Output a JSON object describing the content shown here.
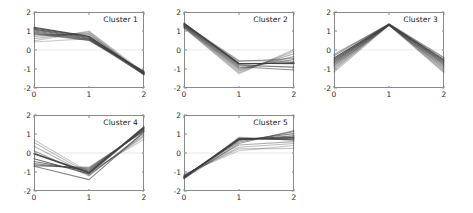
{
  "figure": {
    "width": 473,
    "height": 213,
    "background": "#ffffff",
    "layout": "2 rows x 3 columns of small-multiple line panels; 5 panels drawn, bottom-right cell empty",
    "line_color": "#404040",
    "frame_color": "#8a8a8a",
    "tick_label_color": "#2b2b2b"
  },
  "chart_data": {
    "type": "line",
    "title": "",
    "xlabel": "",
    "ylabel": "",
    "xlim": [
      0,
      2
    ],
    "ylim": [
      -2,
      2
    ],
    "xticks": [
      0,
      1,
      2
    ],
    "xticklabels": [
      "0",
      "1",
      "2"
    ],
    "yticks": [
      -2,
      -1,
      0,
      1,
      2
    ],
    "yticklabels": [
      "-2",
      "-1",
      "0",
      "1",
      "2"
    ],
    "x": [
      0,
      1,
      2
    ],
    "grid": false,
    "legend": "none",
    "panels": [
      {
        "label": "Cluster 1",
        "row": 0,
        "col": 0,
        "series": [
          {
            "name": "s1",
            "values": [
              1.2,
              0.72,
              -1.22
            ],
            "alpha": 0.85
          },
          {
            "name": "s2",
            "values": [
              1.15,
              0.7,
              -1.25
            ],
            "alpha": 0.8
          },
          {
            "name": "s3",
            "values": [
              1.1,
              0.66,
              -1.18
            ],
            "alpha": 0.75
          },
          {
            "name": "s4",
            "values": [
              1.05,
              0.62,
              -1.3
            ],
            "alpha": 0.7
          },
          {
            "name": "s5",
            "values": [
              1.0,
              0.58,
              -1.2
            ],
            "alpha": 0.65
          },
          {
            "name": "s6",
            "values": [
              0.95,
              0.55,
              -1.15
            ],
            "alpha": 0.6
          },
          {
            "name": "s7",
            "values": [
              0.9,
              0.52,
              -1.28
            ],
            "alpha": 0.55
          },
          {
            "name": "s8",
            "values": [
              0.85,
              0.5,
              -1.1
            ],
            "alpha": 0.5
          },
          {
            "name": "s9",
            "values": [
              0.8,
              0.82,
              -1.24
            ],
            "alpha": 0.45
          },
          {
            "name": "s10",
            "values": [
              0.72,
              0.88,
              -1.3
            ],
            "alpha": 0.4
          },
          {
            "name": "s11",
            "values": [
              0.6,
              0.95,
              -1.26
            ],
            "alpha": 0.35
          },
          {
            "name": "s12",
            "values": [
              0.48,
              1.0,
              -1.2
            ],
            "alpha": 0.3
          },
          {
            "name": "s13",
            "values": [
              0.42,
              0.6,
              -1.12
            ],
            "alpha": 0.28
          }
        ]
      },
      {
        "label": "Cluster 2",
        "row": 0,
        "col": 1,
        "series": [
          {
            "name": "s1",
            "values": [
              1.42,
              -0.72,
              -0.7
            ],
            "alpha": 0.88
          },
          {
            "name": "s2",
            "values": [
              1.38,
              -0.7,
              -0.72
            ],
            "alpha": 0.82
          },
          {
            "name": "s3",
            "values": [
              1.35,
              -0.75,
              -0.66
            ],
            "alpha": 0.76
          },
          {
            "name": "s4",
            "values": [
              1.32,
              -0.8,
              -0.9
            ],
            "alpha": 0.68
          },
          {
            "name": "s5",
            "values": [
              1.28,
              -0.88,
              -1.05
            ],
            "alpha": 0.6
          },
          {
            "name": "s6",
            "values": [
              1.25,
              -0.95,
              -0.5
            ],
            "alpha": 0.54
          },
          {
            "name": "s7",
            "values": [
              1.22,
              -1.02,
              -0.35
            ],
            "alpha": 0.48
          },
          {
            "name": "s8",
            "values": [
              1.2,
              -1.1,
              -0.2
            ],
            "alpha": 0.42
          },
          {
            "name": "s9",
            "values": [
              1.18,
              -1.18,
              -0.08
            ],
            "alpha": 0.36
          },
          {
            "name": "s10",
            "values": [
              1.15,
              -1.25,
              0.02
            ],
            "alpha": 0.3
          },
          {
            "name": "s11",
            "values": [
              1.3,
              -0.6,
              -0.45
            ],
            "alpha": 0.45
          },
          {
            "name": "s12",
            "values": [
              1.36,
              -0.55,
              -0.6
            ],
            "alpha": 0.4
          }
        ]
      },
      {
        "label": "Cluster 3",
        "row": 0,
        "col": 2,
        "series": [
          {
            "name": "s1",
            "values": [
              -0.42,
              1.36,
              -0.52
            ],
            "alpha": 0.88
          },
          {
            "name": "s2",
            "values": [
              -0.5,
              1.34,
              -0.58
            ],
            "alpha": 0.82
          },
          {
            "name": "s3",
            "values": [
              -0.58,
              1.33,
              -0.66
            ],
            "alpha": 0.76
          },
          {
            "name": "s4",
            "values": [
              -0.66,
              1.35,
              -0.74
            ],
            "alpha": 0.7
          },
          {
            "name": "s5",
            "values": [
              -0.74,
              1.32,
              -0.82
            ],
            "alpha": 0.62
          },
          {
            "name": "s6",
            "values": [
              -0.82,
              1.3,
              -0.9
            ],
            "alpha": 0.55
          },
          {
            "name": "s7",
            "values": [
              -0.9,
              1.34,
              -0.98
            ],
            "alpha": 0.48
          },
          {
            "name": "s8",
            "values": [
              -0.98,
              1.31,
              -1.06
            ],
            "alpha": 0.42
          },
          {
            "name": "s9",
            "values": [
              -1.06,
              1.33,
              -1.14
            ],
            "alpha": 0.36
          },
          {
            "name": "s10",
            "values": [
              -1.16,
              1.3,
              -1.2
            ],
            "alpha": 0.3
          },
          {
            "name": "s11",
            "values": [
              -0.3,
              1.38,
              -0.4
            ],
            "alpha": 0.5
          },
          {
            "name": "s12",
            "values": [
              -0.22,
              1.36,
              -0.46
            ],
            "alpha": 0.4
          }
        ]
      },
      {
        "label": "Cluster 4",
        "row": 1,
        "col": 0,
        "series": [
          {
            "name": "s1",
            "values": [
              -0.02,
              -1.02,
              1.34
            ],
            "alpha": 0.88
          },
          {
            "name": "s2",
            "values": [
              -0.05,
              -1.05,
              1.38
            ],
            "alpha": 0.82
          },
          {
            "name": "s3",
            "values": [
              -0.3,
              -1.1,
              1.3
            ],
            "alpha": 0.76
          },
          {
            "name": "s4",
            "values": [
              -0.45,
              -0.95,
              1.26
            ],
            "alpha": 0.7
          },
          {
            "name": "s5",
            "values": [
              -0.55,
              -0.88,
              1.22
            ],
            "alpha": 0.62
          },
          {
            "name": "s6",
            "values": [
              -0.62,
              -0.82,
              1.18
            ],
            "alpha": 0.56
          },
          {
            "name": "s7",
            "values": [
              -0.68,
              -0.76,
              1.14
            ],
            "alpha": 0.5
          },
          {
            "name": "s8",
            "values": [
              -0.7,
              -1.4,
              1.12
            ],
            "alpha": 0.62
          },
          {
            "name": "s9",
            "values": [
              0.12,
              -1.2,
              1.05
            ],
            "alpha": 0.46
          },
          {
            "name": "s10",
            "values": [
              0.35,
              -1.15,
              0.95
            ],
            "alpha": 0.4
          },
          {
            "name": "s11",
            "values": [
              0.55,
              -1.08,
              0.85
            ],
            "alpha": 0.34
          },
          {
            "name": "s12",
            "values": [
              0.7,
              -1.0,
              0.72
            ],
            "alpha": 0.28
          }
        ]
      },
      {
        "label": "Cluster 5",
        "row": 1,
        "col": 1,
        "series": [
          {
            "name": "s1",
            "values": [
              -1.3,
              0.74,
              0.78
            ],
            "alpha": 0.88
          },
          {
            "name": "s2",
            "values": [
              -1.28,
              0.72,
              0.82
            ],
            "alpha": 0.82
          },
          {
            "name": "s3",
            "values": [
              -1.26,
              0.76,
              0.7
            ],
            "alpha": 0.76
          },
          {
            "name": "s4",
            "values": [
              -1.32,
              0.7,
              0.9
            ],
            "alpha": 0.7
          },
          {
            "name": "s5",
            "values": [
              -1.24,
              0.66,
              1.02
            ],
            "alpha": 0.62
          },
          {
            "name": "s6",
            "values": [
              -1.22,
              0.58,
              1.12
            ],
            "alpha": 0.55
          },
          {
            "name": "s7",
            "values": [
              -1.34,
              0.5,
              1.18
            ],
            "alpha": 0.48
          },
          {
            "name": "s8",
            "values": [
              -1.2,
              0.42,
              0.6
            ],
            "alpha": 0.42
          },
          {
            "name": "s9",
            "values": [
              -1.18,
              0.3,
              0.5
            ],
            "alpha": 0.36
          },
          {
            "name": "s10",
            "values": [
              -1.16,
              0.22,
              0.24
            ],
            "alpha": 0.3
          },
          {
            "name": "s11",
            "values": [
              -1.36,
              0.82,
              0.68
            ],
            "alpha": 0.5
          },
          {
            "name": "s12",
            "values": [
              -1.12,
              0.12,
              0.4
            ],
            "alpha": 0.26
          }
        ]
      }
    ],
    "empty_cells": [
      {
        "row": 1,
        "col": 2
      }
    ]
  },
  "geometry": {
    "panel_width": 110,
    "panel_height": 76,
    "col_left": [
      34,
      184,
      334
    ],
    "row_top": [
      12,
      115
    ]
  }
}
